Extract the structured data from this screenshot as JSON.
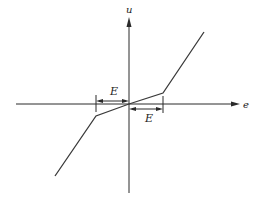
{
  "diagram": {
    "title": "",
    "axes": {
      "x_label": "e",
      "y_label": "u"
    },
    "dimension_labels": {
      "left": "E",
      "right": "E"
    },
    "curve": {
      "description": "piecewise-linear characteristic with reduced slope in dead band of width E on each side of origin",
      "points": [
        [
          55,
          176
        ],
        [
          96,
          116
        ],
        [
          129,
          104
        ],
        [
          163,
          93
        ],
        [
          204,
          32
        ]
      ]
    },
    "colors": {
      "line": "#2a2a2a",
      "background": "#ffffff"
    }
  }
}
